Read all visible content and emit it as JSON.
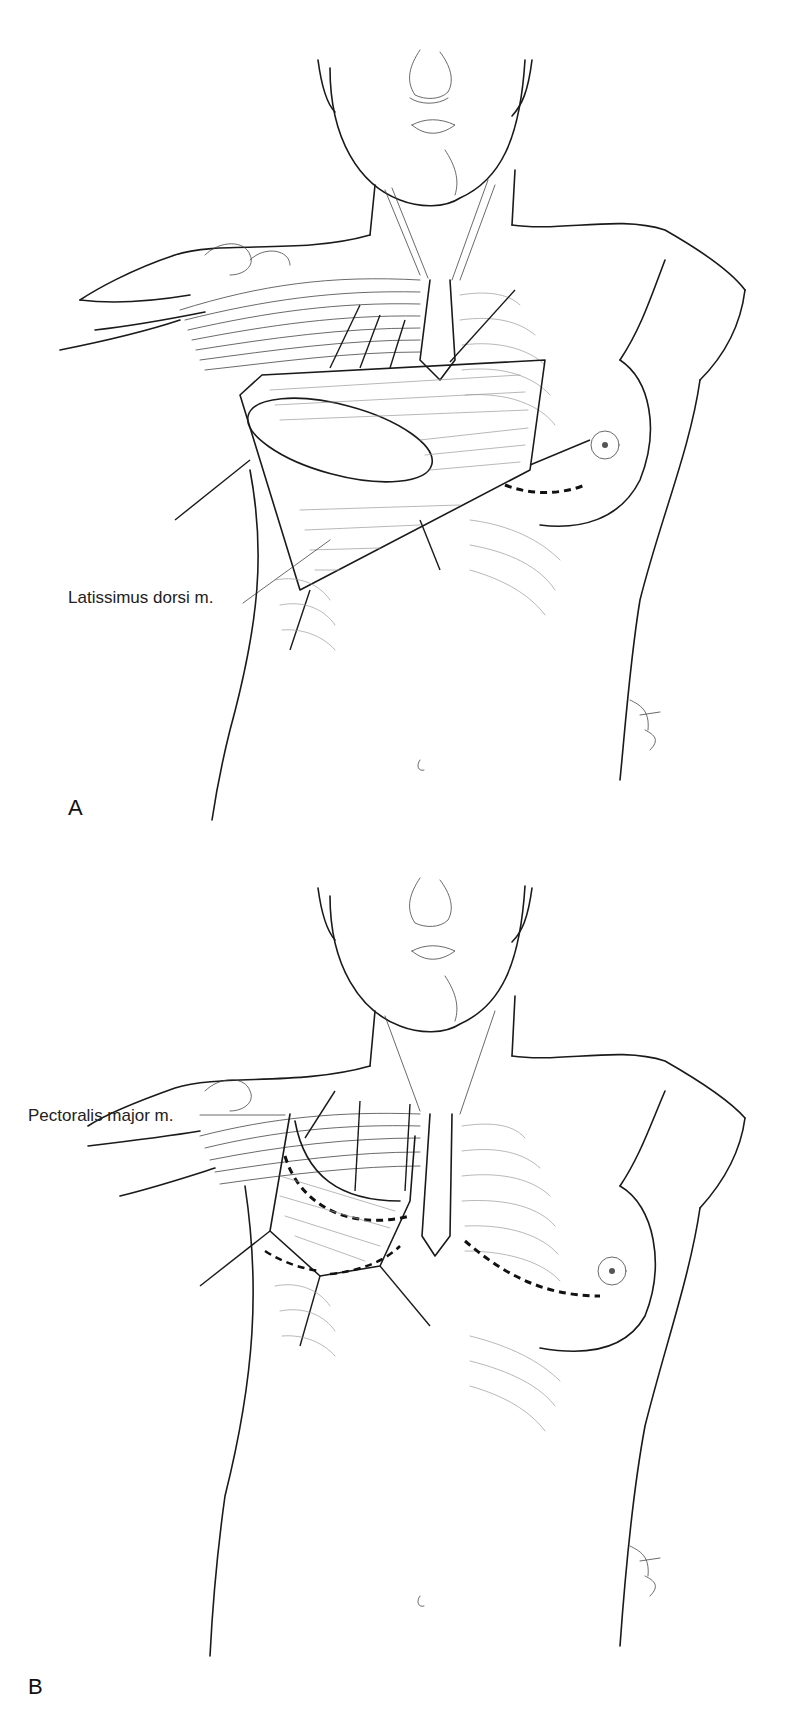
{
  "figure": {
    "panels": [
      {
        "letter": "A",
        "label": "Latissimus dorsi m.",
        "signature": "K.Hirsh"
      },
      {
        "letter": "B",
        "label": "Pectoralis major m.",
        "signature": "K.Hirsh"
      }
    ],
    "colors": {
      "line": "#1a1a1a",
      "background": "#ffffff"
    }
  }
}
